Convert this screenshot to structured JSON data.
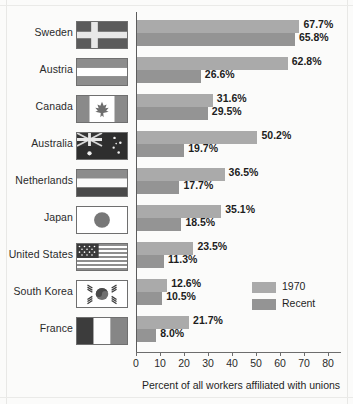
{
  "chart_data": {
    "type": "bar",
    "title": "",
    "xlabel": "Percent of all workers affiliated with unions",
    "ylabel": "",
    "orientation": "horizontal",
    "xlim": [
      0,
      85
    ],
    "grid": false,
    "legend_position": "right",
    "categories": [
      "Sweden",
      "Austria",
      "Canada",
      "Australia",
      "Netherlands",
      "Japan",
      "United States",
      "South Korea",
      "France"
    ],
    "series": [
      {
        "name": "1970",
        "color": "#aaaaaa",
        "values": [
          67.7,
          62.8,
          31.6,
          50.2,
          36.5,
          35.1,
          23.5,
          12.6,
          21.7
        ],
        "labels": [
          "67.7%",
          "62.8%",
          "31.6%",
          "50.2%",
          "36.5%",
          "35.1%",
          "23.5%",
          "12.6%",
          "21.7%"
        ]
      },
      {
        "name": "Recent",
        "color": "#949494",
        "values": [
          65.8,
          26.6,
          29.5,
          19.7,
          17.7,
          18.5,
          11.3,
          10.5,
          8.0
        ],
        "labels": [
          "65.8%",
          "26.6%",
          "29.5%",
          "19.7%",
          "17.7%",
          "18.5%",
          "11.3%",
          "10.5%",
          "8.0%"
        ]
      }
    ],
    "xticks": [
      0,
      10,
      20,
      30,
      40,
      50,
      60,
      70,
      80
    ],
    "xtick_labels": [
      "0",
      "10",
      "20",
      "30",
      "40",
      "50",
      "60",
      "70",
      "80"
    ]
  },
  "rows": [
    {
      "country": "Sweden",
      "flag": "flag-sweden",
      "v1970": "67.7%",
      "vrecent": "65.8%"
    },
    {
      "country": "Austria",
      "flag": "flag-austria",
      "v1970": "62.8%",
      "vrecent": "26.6%"
    },
    {
      "country": "Canada",
      "flag": "flag-canada",
      "v1970": "31.6%",
      "vrecent": "29.5%"
    },
    {
      "country": "Australia",
      "flag": "flag-australia",
      "v1970": "50.2%",
      "vrecent": "19.7%"
    },
    {
      "country": "Netherlands",
      "flag": "flag-netherlands",
      "v1970": "36.5%",
      "vrecent": "17.7%"
    },
    {
      "country": "Japan",
      "flag": "flag-japan",
      "v1970": "35.1%",
      "vrecent": "18.5%"
    },
    {
      "country": "United States",
      "flag": "flag-united-states",
      "v1970": "23.5%",
      "vrecent": "11.3%"
    },
    {
      "country": "South Korea",
      "flag": "flag-south-korea",
      "v1970": "12.6%",
      "vrecent": "10.5%"
    },
    {
      "country": "France",
      "flag": "flag-france",
      "v1970": "21.7%",
      "vrecent": "8.0%"
    }
  ],
  "legend": {
    "items": [
      {
        "label": "1970",
        "color": "#aaaaaa"
      },
      {
        "label": "Recent",
        "color": "#949494"
      }
    ]
  },
  "axis": {
    "title": "Percent of all workers affiliated with unions",
    "ticks": [
      "0",
      "10",
      "20",
      "30",
      "40",
      "50",
      "60",
      "70",
      "80"
    ]
  }
}
